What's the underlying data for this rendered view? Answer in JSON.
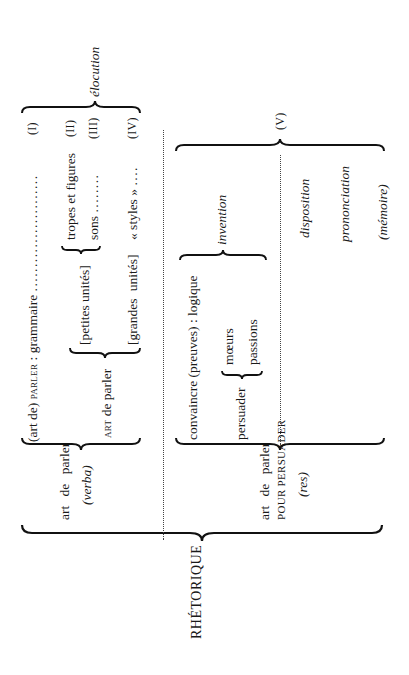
{
  "diagram": {
    "title": "RHÉTORIQUE",
    "orientation": "rotated 90° counter-clockwise",
    "verba_branch": {
      "label_line1": "art de parler",
      "label_line2": "(verba)",
      "row1": {
        "text": "(art de) PARLER : grammaire",
        "prefix": "(art de) ",
        "smallcaps": "parler",
        "suffix": " : grammaire",
        "leader": "........................",
        "numeral": "(I)"
      },
      "art_de_parler": {
        "smallcaps": "art",
        "text": " de parler"
      },
      "petites_unites": "[petites unités]",
      "grandes_unites": "[grandes unités]",
      "tropes": {
        "text": "tropes et figures",
        "numeral": "(II)"
      },
      "sons": {
        "text": "sons",
        "leader": "........",
        "numeral": "(III)"
      },
      "styles": {
        "text": "« styles »",
        "leader": "....",
        "numeral": "(IV)"
      },
      "group_label": "élocution"
    },
    "res_branch": {
      "label_line1": "art de parler",
      "label_line2": "POUR PERSUADER",
      "label_line3": "(res)",
      "convaincre": "convaincre (preuves) : logique",
      "persuader": "persuader",
      "moeurs": "mœurs",
      "passions": "passions",
      "invention": "invention",
      "disposition": "disposition",
      "prononciation": "prononciation",
      "memoire": "(mémoire)",
      "numeral": "(V)"
    }
  }
}
